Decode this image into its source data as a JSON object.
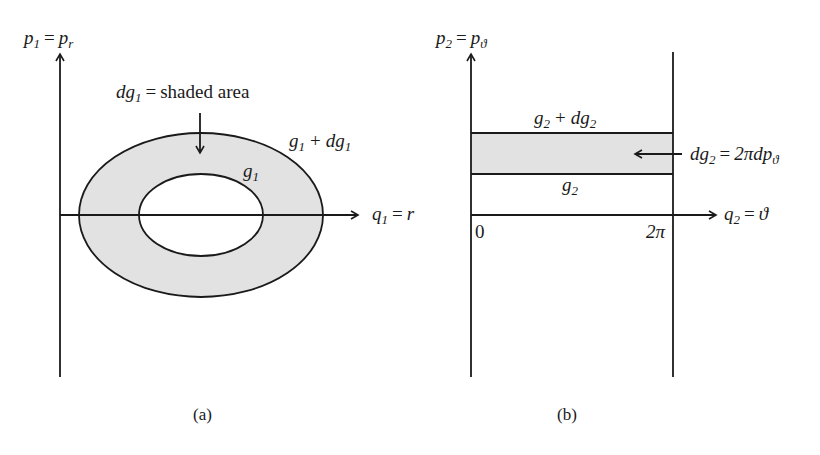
{
  "panel_a": {
    "caption": "(a)",
    "y_axis": {
      "symbol": "p",
      "sub": "1",
      "eq": "=",
      "symbol2": "p",
      "sub2": "r"
    },
    "x_axis": {
      "symbol": "q",
      "sub": "1",
      "eq": "=",
      "rhs": "r"
    },
    "annotation": {
      "lhs": "dg",
      "sub": "1",
      "eq": "=",
      "rhs": "shaded area"
    },
    "outer_label": {
      "a": "g",
      "a_sub": "1",
      "op": "+",
      "b": "dg",
      "b_sub": "1"
    },
    "inner_label": {
      "a": "g",
      "a_sub": "1"
    },
    "shade_color": "#e2e2e2"
  },
  "panel_b": {
    "caption": "(b)",
    "y_axis": {
      "symbol": "p",
      "sub": "2",
      "eq": "=",
      "symbol2": "p",
      "sub2": "ϑ"
    },
    "x_axis": {
      "symbol": "q",
      "sub": "2",
      "eq": "=",
      "rhs": "ϑ"
    },
    "tick_start": "0",
    "tick_end": "2π",
    "upper_label": {
      "a": "g",
      "a_sub": "2",
      "op": "+",
      "b": "dg",
      "b_sub": "2"
    },
    "lower_label": {
      "a": "g",
      "a_sub": "2"
    },
    "annotation": {
      "lhs": "dg",
      "sub": "2",
      "eq": "=",
      "rhs": "2πdp",
      "rhs_sub": "ϑ"
    },
    "shade_color": "#e2e2e2"
  }
}
